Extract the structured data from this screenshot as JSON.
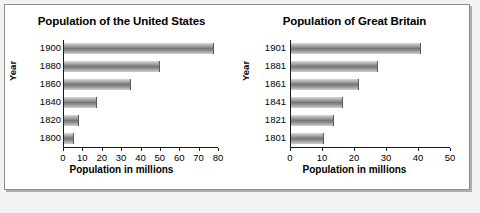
{
  "page": {
    "background_color": "#f2f2f0",
    "panel_background": "#ffffff",
    "border_color": "#8d8d8d",
    "bar_color": "#8a8a8a"
  },
  "chart_data": [
    {
      "type": "bar",
      "orientation": "horizontal",
      "title": "Population of the United States",
      "xlabel": "Population in millions",
      "ylabel": "Year",
      "categories": [
        "1900",
        "1880",
        "1860",
        "1840",
        "1820",
        "1800"
      ],
      "values": [
        78,
        50,
        35,
        17,
        8,
        5
      ],
      "xlim": [
        0,
        80
      ],
      "xticks": [
        0,
        10,
        20,
        30,
        40,
        50,
        60,
        70,
        80
      ],
      "xticklabels": [
        "0",
        "10",
        "20",
        "30",
        "40",
        "50",
        "60",
        "70",
        "80"
      ],
      "grid": false,
      "legend": null
    },
    {
      "type": "bar",
      "orientation": "horizontal",
      "title": "Population of Great Britain",
      "xlabel": "Population in millions",
      "ylabel": "Year",
      "categories": [
        "1901",
        "1881",
        "1861",
        "1841",
        "1821",
        "1801"
      ],
      "values": [
        41,
        27.5,
        21.5,
        16.5,
        13.5,
        10.5
      ],
      "xlim": [
        0,
        50
      ],
      "xticks": [
        0,
        10,
        20,
        30,
        40,
        50
      ],
      "xticklabels": [
        "0",
        "10",
        "20",
        "30",
        "40",
        "50"
      ],
      "grid": false,
      "legend": null
    }
  ]
}
